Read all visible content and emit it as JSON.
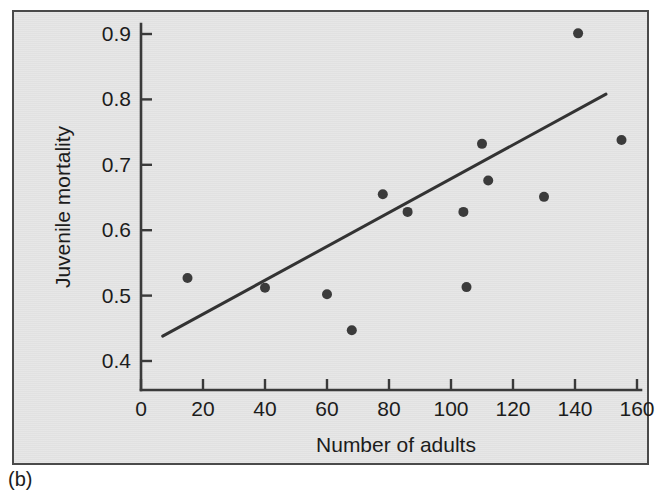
{
  "figure": {
    "caption": "(b)",
    "background_color": "#e3e3e3",
    "frame_color": "#4a4a4a"
  },
  "chart_data": {
    "type": "scatter",
    "title": "",
    "xlabel": "Number of adults",
    "ylabel": "Juvenile mortality",
    "xlim": [
      0,
      165
    ],
    "ylim": [
      0.37,
      0.93
    ],
    "xticks": [
      0,
      20,
      40,
      60,
      80,
      100,
      120,
      140,
      160
    ],
    "xtick_labels": [
      "0",
      "20",
      "40",
      "60",
      "80",
      "100",
      "120",
      "140",
      "160"
    ],
    "yticks": [
      0.4,
      0.5,
      0.6,
      0.7,
      0.8,
      0.9
    ],
    "ytick_labels": [
      "0.4",
      "0.5",
      "0.6",
      "0.7",
      "0.8",
      "0.9"
    ],
    "grid": false,
    "legend": null,
    "marker_color": "#3b3b3b",
    "marker_size": 9,
    "points": [
      {
        "x": 15,
        "y": 0.527
      },
      {
        "x": 40,
        "y": 0.512
      },
      {
        "x": 60,
        "y": 0.502
      },
      {
        "x": 68,
        "y": 0.447
      },
      {
        "x": 78,
        "y": 0.655
      },
      {
        "x": 86,
        "y": 0.628
      },
      {
        "x": 104,
        "y": 0.628
      },
      {
        "x": 105,
        "y": 0.513
      },
      {
        "x": 110,
        "y": 0.732
      },
      {
        "x": 112,
        "y": 0.676
      },
      {
        "x": 130,
        "y": 0.651
      },
      {
        "x": 141,
        "y": 0.901
      },
      {
        "x": 155,
        "y": 0.738
      }
    ],
    "fit_line": {
      "type": "linear-regression",
      "color": "#333333",
      "x_start": 7,
      "y_start": 0.438,
      "x_end": 150,
      "y_end": 0.808
    }
  }
}
